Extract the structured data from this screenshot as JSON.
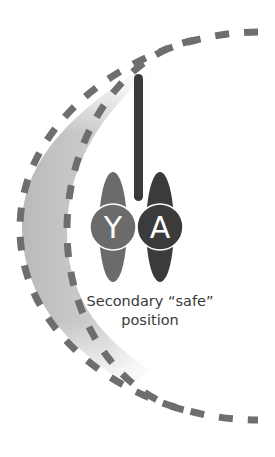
{
  "diagram": {
    "caption_line1": "Secondary “safe”",
    "caption_line2": "position",
    "nodes": [
      {
        "id": "Y",
        "label": "Y",
        "color": "#6b6b6b"
      },
      {
        "id": "A",
        "label": "A",
        "color": "#3b3b3b"
      }
    ],
    "bar_color": "#3a3a3a",
    "arc_color": "#6e6e6e",
    "band_gradient": [
      "#bdbdbd",
      "#ffffff"
    ]
  }
}
